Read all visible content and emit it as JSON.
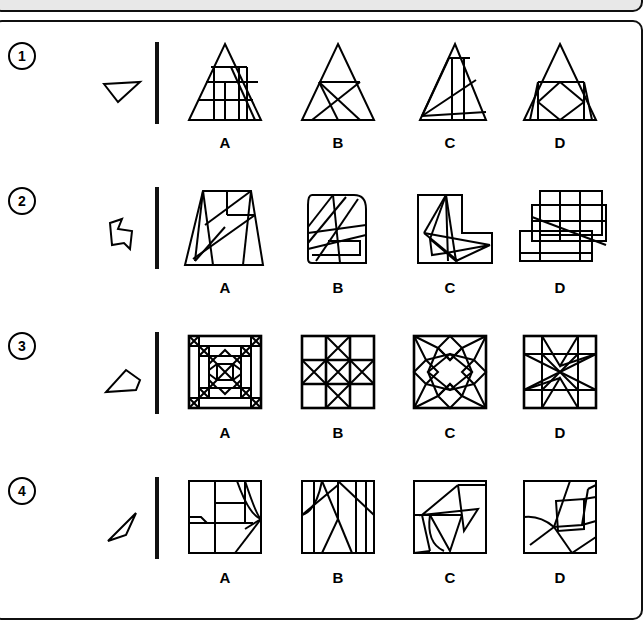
{
  "page": {
    "type": "visual-reasoning-worksheet",
    "background": "#ffffff",
    "ink": "#000000",
    "panel_fill": "#e8e8e8"
  },
  "rows": [
    {
      "number": "1",
      "prompt_shape": "small-triangle-pointing-down",
      "options": [
        {
          "letter": "A",
          "figure": "triangle-with-grid-lines"
        },
        {
          "letter": "B",
          "figure": "triangle-with-crossing-lines"
        },
        {
          "letter": "C",
          "figure": "triangle-with-vertical-and-diagonal-lines"
        },
        {
          "letter": "D",
          "figure": "triangle-with-inner-diamond"
        }
      ]
    },
    {
      "number": "2",
      "prompt_shape": "small-irregular-quadrilateral-flag",
      "options": [
        {
          "letter": "A",
          "figure": "trapezoid-with-diagonals"
        },
        {
          "letter": "B",
          "figure": "rounded-square-with-slanted-lines"
        },
        {
          "letter": "C",
          "figure": "l-shape-with-spikes"
        },
        {
          "letter": "D",
          "figure": "overlapping-rectangles-grid"
        }
      ]
    },
    {
      "number": "3",
      "prompt_shape": "small-slanted-quadrilateral",
      "options": [
        {
          "letter": "A",
          "figure": "square-nested-quilt-pattern"
        },
        {
          "letter": "B",
          "figure": "three-by-three-grid-with-x-plus"
        },
        {
          "letter": "C",
          "figure": "square-star-burst-pattern"
        },
        {
          "letter": "D",
          "figure": "square-pinwheel-star"
        }
      ]
    },
    {
      "number": "4",
      "prompt_shape": "small-narrow-leaf-sliver",
      "options": [
        {
          "letter": "A",
          "figure": "square-with-boxes-and-curve"
        },
        {
          "letter": "B",
          "figure": "square-with-vertical-strips-and-arc"
        },
        {
          "letter": "C",
          "figure": "square-with-angular-zigzag"
        },
        {
          "letter": "D",
          "figure": "square-with-overlapping-polygons"
        }
      ]
    }
  ]
}
